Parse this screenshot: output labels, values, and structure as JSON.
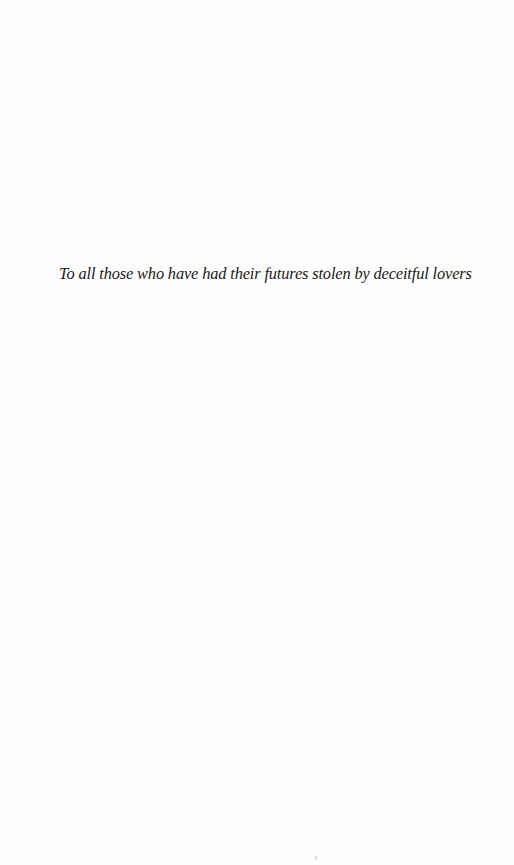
{
  "page": {
    "background_color": "#fdfdfc",
    "text_color": "#1a1a1a"
  },
  "dedication": {
    "text": "To all those who have had their futures stolen by deceitful lovers"
  }
}
